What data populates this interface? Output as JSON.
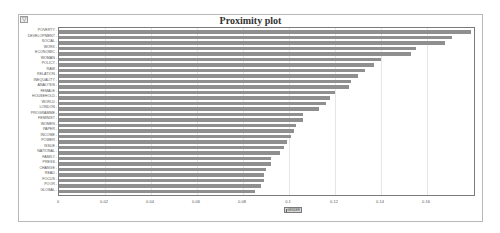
{
  "window": {
    "corner_icon": "collapse-toggle-icon"
  },
  "chart_data": {
    "type": "bar",
    "orientation": "horizontal",
    "title": "Proximity plot",
    "xlabel": "",
    "ylabel": "",
    "xlim": [
      0,
      0.18
    ],
    "grid": true,
    "x_ticks": [
      "0",
      "0.02",
      "0.04",
      "0.06",
      "0.08",
      "0.1",
      "0.12",
      "0.14",
      "0.16"
    ],
    "categories": [
      "POVERTY",
      "DEVELOPMENT",
      "SOCIAL",
      "WORK",
      "ECONOMIC",
      "WOMAN",
      "POLICY",
      "RAW",
      "RELATION",
      "INEQUALITY",
      "ANALYSIS",
      "FEMALE",
      "HOUSEHOLD",
      "WORLD",
      "LONDON",
      "PROGRAMME",
      "FEMINIST",
      "WOMEN",
      "PAPER",
      "INCOME",
      "POWER",
      "ISSUE",
      "NATIONAL",
      "FAMILY",
      "PRESS",
      "CHANGE",
      "READ",
      "FOCUS",
      "POOR",
      "GLOBAL"
    ],
    "series": [
      {
        "name": "GENDER",
        "values": [
          0.179,
          0.171,
          0.168,
          0.155,
          0.153,
          0.14,
          0.137,
          0.133,
          0.13,
          0.127,
          0.126,
          0.12,
          0.118,
          0.116,
          0.113,
          0.106,
          0.106,
          0.103,
          0.102,
          0.101,
          0.099,
          0.098,
          0.096,
          0.092,
          0.092,
          0.09,
          0.089,
          0.089,
          0.088,
          0.085
        ]
      }
    ],
    "legend": {
      "position": "bottom",
      "entries": [
        "GENDER"
      ]
    },
    "bar_color": "#8f8f8f"
  }
}
